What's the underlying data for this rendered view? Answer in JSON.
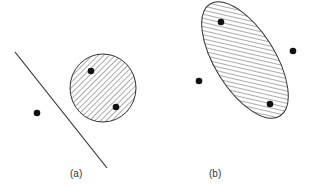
{
  "panels": [
    {
      "label": "(a)",
      "label_pos": [
        70,
        168
      ],
      "separator_line": {
        "x1": 15,
        "y1": 52,
        "x2": 107,
        "y2": 168
      },
      "region": {
        "cx": 103,
        "cy": 88,
        "rx": 33,
        "ry": 34,
        "rotate": 0
      },
      "points_inside": [
        [
          91,
          71
        ],
        [
          116,
          107
        ]
      ],
      "points_outside": [
        [
          37,
          113
        ]
      ]
    },
    {
      "label": "(b)",
      "label_pos": [
        209,
        168
      ],
      "region": {
        "cx": 245,
        "cy": 60,
        "rx": 66,
        "ry": 30,
        "rotate": 58
      },
      "points_inside": [
        [
          221,
          22
        ],
        [
          270,
          104
        ]
      ],
      "points_outside": [
        [
          293,
          51
        ],
        [
          199,
          81
        ]
      ]
    }
  ],
  "colors": {
    "stroke": "#333333",
    "point": "#111111",
    "hatch": "#444444",
    "background": "#ffffff"
  }
}
